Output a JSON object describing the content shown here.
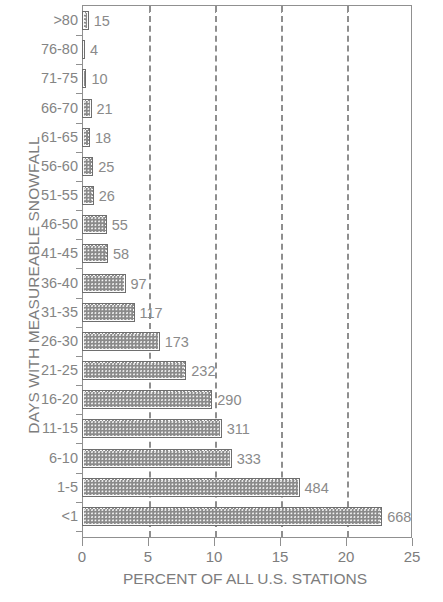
{
  "chart_data": {
    "type": "bar",
    "orientation": "horizontal",
    "title": "",
    "xlabel": "PERCENT OF ALL U.S. STATIONS",
    "ylabel": "DAYS WITH MEASUREABLE SNOWFALL",
    "xlim": [
      0,
      25
    ],
    "xticks": [
      0,
      5,
      10,
      15,
      20,
      25
    ],
    "xtick_labels": [
      "0",
      "5",
      "10",
      "15",
      "20",
      "25"
    ],
    "gridlines_at": [
      5,
      10,
      15,
      20
    ],
    "grid": "vertical-dashed",
    "legend": "none",
    "total_stations": 2937,
    "categories": [
      ">80",
      "76-80",
      "71-75",
      "66-70",
      "61-65",
      "56-60",
      "51-55",
      "46-50",
      "41-45",
      "36-40",
      "31-35",
      "26-30",
      "21-25",
      "16-20",
      "11-15",
      "6-10",
      "1-5",
      "<1"
    ],
    "counts": [
      15,
      4,
      10,
      21,
      18,
      25,
      26,
      55,
      58,
      97,
      117,
      173,
      232,
      290,
      311,
      333,
      484,
      668
    ],
    "data_labels": [
      "15",
      "4",
      "10",
      "21",
      "18",
      "25",
      "26",
      "55",
      "58",
      "97",
      "117",
      "173",
      "232",
      "290",
      "311",
      "333",
      "484",
      "668"
    ],
    "values": [
      0.51,
      0.14,
      0.34,
      0.72,
      0.61,
      0.85,
      0.89,
      1.87,
      1.97,
      3.3,
      3.98,
      5.89,
      7.9,
      9.87,
      10.59,
      11.34,
      16.48,
      22.74
    ],
    "bars": [
      {
        "category": ">80",
        "count": 15,
        "percent": 0.51,
        "label": "15"
      },
      {
        "category": "76-80",
        "count": 4,
        "percent": 0.14,
        "label": "4"
      },
      {
        "category": "71-75",
        "count": 10,
        "percent": 0.34,
        "label": "10"
      },
      {
        "category": "66-70",
        "count": 21,
        "percent": 0.72,
        "label": "21"
      },
      {
        "category": "61-65",
        "count": 18,
        "percent": 0.61,
        "label": "18"
      },
      {
        "category": "56-60",
        "count": 25,
        "percent": 0.85,
        "label": "25"
      },
      {
        "category": "51-55",
        "count": 26,
        "percent": 0.89,
        "label": "26"
      },
      {
        "category": "46-50",
        "count": 55,
        "percent": 1.87,
        "label": "55"
      },
      {
        "category": "41-45",
        "count": 58,
        "percent": 1.97,
        "label": "58"
      },
      {
        "category": "36-40",
        "count": 97,
        "percent": 3.3,
        "label": "97"
      },
      {
        "category": "31-35",
        "count": 117,
        "percent": 3.98,
        "label": "117"
      },
      {
        "category": "26-30",
        "count": 173,
        "percent": 5.89,
        "label": "173"
      },
      {
        "category": "21-25",
        "count": 232,
        "percent": 7.9,
        "label": "232"
      },
      {
        "category": "16-20",
        "count": 290,
        "percent": 9.87,
        "label": "290"
      },
      {
        "category": "11-15",
        "count": 311,
        "percent": 10.59,
        "label": "311"
      },
      {
        "category": "6-10",
        "count": 333,
        "percent": 11.34,
        "label": "333"
      },
      {
        "category": "1-5",
        "count": 484,
        "percent": 16.48,
        "label": "484"
      },
      {
        "category": "<1",
        "count": 668,
        "percent": 22.74,
        "label": "668"
      }
    ]
  },
  "style": {
    "bar_fill": "#8d8d8d",
    "bar_border": "#6e6e6e",
    "axis_color": "#909090",
    "grid_color": "#8e8e8e",
    "text_color": "#7d7d7d",
    "background": "#ffffff"
  }
}
